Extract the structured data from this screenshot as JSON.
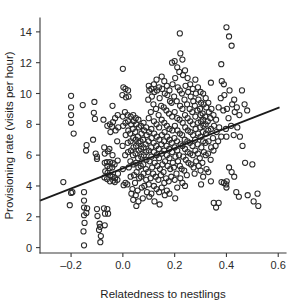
{
  "chart_data": {
    "type": "scatter",
    "title": "",
    "xlabel": "Relatedness to nestlings",
    "ylabel": "Provisioning rate (visits per hour)",
    "xlim": [
      -0.32,
      0.63
    ],
    "ylim": [
      -0.35,
      14.9
    ],
    "xticks": [
      -0.2,
      0.0,
      0.2,
      0.4,
      0.6
    ],
    "xticklabels": [
      "–0.2",
      "0.0",
      "0.2",
      "0.4",
      "0.6"
    ],
    "yticks": [
      0,
      2,
      4,
      6,
      8,
      10,
      12,
      14
    ],
    "yticklabels": [
      "0",
      "2",
      "4",
      "6",
      "8",
      "10",
      "12",
      "14"
    ],
    "grid": false,
    "legend": null,
    "marker": {
      "shape": "open-circle",
      "size_px": 5.2,
      "edge_color": "#2a2a2a",
      "face_color": "none"
    },
    "trendline": {
      "type": "linear-fit",
      "x_start": -0.32,
      "y_start": 3.05,
      "x_end": 0.605,
      "y_end": 9.1,
      "slope": 6.47,
      "intercept": 5.12,
      "color": "#1a1a1a"
    },
    "x": [
      -0.23,
      -0.2,
      -0.2,
      -0.2,
      -0.2,
      -0.19,
      -0.195,
      -0.2,
      -0.205,
      -0.155,
      -0.15,
      -0.15,
      -0.15,
      -0.15,
      -0.148,
      -0.152,
      -0.15,
      -0.14,
      -0.142,
      -0.138,
      -0.141,
      -0.115,
      -0.11,
      -0.112,
      -0.108,
      -0.105,
      -0.1,
      -0.1,
      -0.1,
      -0.098,
      -0.09,
      -0.088,
      -0.092,
      -0.085,
      -0.087,
      -0.075,
      -0.072,
      -0.07,
      -0.07,
      -0.068,
      -0.071,
      -0.073,
      -0.069,
      -0.07,
      -0.06,
      -0.058,
      -0.062,
      -0.06,
      -0.059,
      -0.061,
      -0.06,
      -0.057,
      -0.05,
      -0.048,
      -0.052,
      -0.05,
      -0.051,
      -0.049,
      -0.05,
      -0.04,
      -0.038,
      -0.042,
      -0.04,
      -0.039,
      -0.041,
      -0.04,
      -0.037,
      -0.03,
      -0.028,
      -0.032,
      -0.03,
      -0.031,
      -0.02,
      -0.018,
      -0.022,
      -0.02,
      -0.019,
      -0.021,
      0.0,
      0.002,
      -0.002,
      0.0,
      0.001,
      -0.001,
      0.0,
      0.003,
      0.01,
      0.012,
      0.008,
      0.01,
      0.011,
      0.009,
      0.01,
      0.02,
      0.022,
      0.018,
      0.02,
      0.021,
      0.019,
      0.02,
      0.023,
      0.017,
      0.03,
      0.032,
      0.028,
      0.03,
      0.031,
      0.029,
      0.03,
      0.033,
      0.04,
      0.042,
      0.038,
      0.04,
      0.041,
      0.039,
      0.04,
      0.043,
      0.037,
      0.04,
      0.05,
      0.052,
      0.048,
      0.05,
      0.051,
      0.049,
      0.05,
      0.053,
      0.047,
      0.05,
      0.052,
      0.06,
      0.062,
      0.058,
      0.06,
      0.061,
      0.059,
      0.06,
      0.063,
      0.057,
      0.06,
      0.07,
      0.072,
      0.068,
      0.07,
      0.071,
      0.069,
      0.07,
      0.073,
      0.08,
      0.082,
      0.078,
      0.08,
      0.081,
      0.079,
      0.08,
      0.083,
      0.077,
      0.09,
      0.092,
      0.088,
      0.09,
      0.091,
      0.089,
      0.09,
      0.093,
      0.1,
      0.102,
      0.098,
      0.1,
      0.101,
      0.099,
      0.1,
      0.103,
      0.097,
      0.1,
      0.102,
      0.11,
      0.112,
      0.108,
      0.11,
      0.111,
      0.109,
      0.11,
      0.113,
      0.107,
      0.11,
      0.12,
      0.122,
      0.118,
      0.12,
      0.121,
      0.119,
      0.12,
      0.123,
      0.117,
      0.12,
      0.122,
      0.13,
      0.132,
      0.128,
      0.13,
      0.131,
      0.129,
      0.13,
      0.133,
      0.127,
      0.13,
      0.14,
      0.142,
      0.138,
      0.14,
      0.141,
      0.139,
      0.14,
      0.143,
      0.137,
      0.14,
      0.142,
      0.15,
      0.152,
      0.148,
      0.15,
      0.151,
      0.149,
      0.15,
      0.153,
      0.147,
      0.15,
      0.16,
      0.162,
      0.158,
      0.16,
      0.161,
      0.159,
      0.16,
      0.163,
      0.157,
      0.16,
      0.162,
      0.17,
      0.172,
      0.168,
      0.17,
      0.171,
      0.169,
      0.17,
      0.173,
      0.167,
      0.17,
      0.18,
      0.182,
      0.178,
      0.18,
      0.181,
      0.179,
      0.18,
      0.183,
      0.177,
      0.18,
      0.19,
      0.192,
      0.188,
      0.19,
      0.191,
      0.189,
      0.19,
      0.193,
      0.187,
      0.2,
      0.202,
      0.198,
      0.2,
      0.201,
      0.199,
      0.2,
      0.203,
      0.197,
      0.2,
      0.202,
      0.21,
      0.212,
      0.208,
      0.21,
      0.211,
      0.209,
      0.21,
      0.213,
      0.207,
      0.21,
      0.22,
      0.222,
      0.218,
      0.22,
      0.221,
      0.219,
      0.22,
      0.223,
      0.217,
      0.22,
      0.222,
      0.23,
      0.232,
      0.228,
      0.23,
      0.231,
      0.229,
      0.23,
      0.233,
      0.227,
      0.23,
      0.24,
      0.242,
      0.238,
      0.24,
      0.241,
      0.239,
      0.24,
      0.243,
      0.237,
      0.24,
      0.25,
      0.252,
      0.248,
      0.25,
      0.251,
      0.249,
      0.25,
      0.253,
      0.247,
      0.26,
      0.262,
      0.258,
      0.26,
      0.261,
      0.259,
      0.26,
      0.263,
      0.27,
      0.272,
      0.268,
      0.27,
      0.271,
      0.269,
      0.27,
      0.273,
      0.28,
      0.282,
      0.278,
      0.28,
      0.281,
      0.279,
      0.28,
      0.283,
      0.277,
      0.29,
      0.292,
      0.288,
      0.29,
      0.291,
      0.289,
      0.29,
      0.293,
      0.3,
      0.302,
      0.298,
      0.3,
      0.301,
      0.299,
      0.3,
      0.303,
      0.297,
      0.3,
      0.302,
      0.31,
      0.312,
      0.308,
      0.31,
      0.311,
      0.309,
      0.31,
      0.313,
      0.307,
      0.31,
      0.32,
      0.322,
      0.318,
      0.32,
      0.321,
      0.319,
      0.32,
      0.323,
      0.33,
      0.332,
      0.328,
      0.33,
      0.331,
      0.329,
      0.33,
      0.34,
      0.342,
      0.338,
      0.34,
      0.341,
      0.339,
      0.34,
      0.35,
      0.352,
      0.348,
      0.35,
      0.351,
      0.36,
      0.362,
      0.358,
      0.36,
      0.37,
      0.372,
      0.368,
      0.37,
      0.38,
      0.382,
      0.378,
      0.38,
      0.381,
      0.39,
      0.392,
      0.388,
      0.39,
      0.4,
      0.402,
      0.398,
      0.4,
      0.401,
      0.399,
      0.4,
      0.41,
      0.412,
      0.408,
      0.41,
      0.42,
      0.422,
      0.418,
      0.42,
      0.43,
      0.432,
      0.428,
      0.43,
      0.44,
      0.442,
      0.438,
      0.45,
      0.452,
      0.448,
      0.46,
      0.462,
      0.47,
      0.472,
      0.48,
      0.482,
      0.5,
      0.505,
      0.52,
      0.523
    ],
    "y": [
      4.25,
      9.85,
      9.1,
      8.6,
      8.1,
      7.4,
      3.6,
      3.55,
      2.75,
      9.25,
      3.6,
      3.05,
      2.6,
      2.1,
      1.6,
      1.05,
      0.15,
      6.65,
      6.3,
      2.55,
      2.25,
      7.0,
      9.45,
      8.75,
      8.35,
      6.1,
      5.9,
      5.75,
      2.5,
      2.05,
      1.55,
      1.35,
      1.15,
      0.75,
      0.35,
      8.3,
      6.5,
      6.1,
      5.5,
      4.95,
      4.55,
      2.55,
      2.2,
      1.45,
      7.9,
      6.25,
      5.55,
      5.3,
      4.85,
      4.45,
      2.5,
      2.2,
      8.0,
      7.5,
      6.4,
      5.55,
      5.15,
      4.7,
      4.3,
      9.2,
      8.15,
      7.85,
      6.0,
      5.5,
      5.2,
      4.6,
      4.35,
      8.4,
      7.6,
      5.4,
      4.5,
      4.25,
      8.6,
      7.8,
      6.9,
      5.65,
      4.8,
      4.4,
      11.6,
      10.4,
      9.9,
      8.5,
      7.9,
      6.6,
      5.1,
      4.05,
      10.3,
      9.75,
      8.8,
      8.1,
      7.3,
      6.0,
      4.2,
      10.2,
      9.8,
      8.6,
      8.2,
      7.6,
      6.8,
      6.2,
      5.2,
      4.1,
      8.5,
      8.0,
      7.4,
      6.9,
      6.3,
      5.6,
      4.6,
      3.5,
      8.6,
      8.2,
      7.7,
      7.1,
      6.5,
      6.0,
      5.4,
      4.7,
      3.8,
      3.1,
      8.4,
      8.0,
      7.5,
      7.0,
      6.6,
      6.1,
      5.5,
      4.9,
      4.2,
      3.4,
      2.7,
      8.3,
      7.8,
      7.2,
      6.8,
      6.3,
      5.8,
      5.2,
      4.5,
      3.7,
      3.0,
      7.9,
      7.4,
      6.9,
      6.4,
      5.9,
      5.3,
      4.6,
      3.9,
      8.1,
      7.6,
      7.0,
      6.5,
      6.0,
      5.4,
      4.8,
      4.0,
      3.2,
      7.8,
      7.3,
      6.7,
      6.2,
      5.7,
      5.1,
      4.4,
      3.6,
      10.5,
      10.2,
      9.6,
      8.4,
      7.5,
      6.9,
      6.3,
      5.6,
      4.9,
      4.1,
      3.3,
      10.3,
      9.8,
      8.8,
      7.7,
      7.1,
      6.5,
      5.9,
      5.2,
      4.5,
      3.5,
      10.6,
      10.1,
      9.3,
      8.2,
      7.4,
      6.8,
      6.2,
      5.5,
      4.8,
      4.0,
      3.0,
      10.9,
      10.2,
      9.0,
      8.0,
      7.2,
      6.6,
      6.0,
      5.3,
      4.6,
      3.8,
      10.4,
      9.7,
      8.6,
      7.8,
      7.0,
      6.4,
      5.8,
      5.1,
      4.4,
      3.6,
      2.8,
      11.1,
      10.3,
      9.2,
      8.3,
      7.3,
      6.7,
      6.1,
      5.4,
      4.7,
      3.9,
      10.8,
      10.0,
      9.1,
      8.1,
      7.5,
      6.9,
      6.3,
      5.6,
      4.9,
      4.2,
      3.4,
      10.5,
      9.9,
      8.9,
      7.9,
      7.2,
      6.6,
      6.0,
      5.3,
      4.5,
      3.7,
      10.2,
      9.5,
      8.7,
      7.7,
      7.0,
      6.4,
      5.8,
      5.1,
      4.3,
      3.5,
      12.0,
      10.6,
      9.4,
      8.5,
      7.6,
      6.8,
      6.2,
      5.5,
      4.6,
      12.1,
      11.0,
      9.8,
      8.8,
      7.9,
      7.1,
      6.5,
      5.9,
      5.2,
      4.4,
      3.2,
      11.7,
      10.4,
      9.5,
      8.4,
      7.6,
      6.9,
      6.3,
      5.6,
      4.8,
      3.9,
      13.9,
      12.6,
      11.4,
      10.2,
      9.2,
      8.3,
      7.4,
      6.7,
      6.0,
      5.3,
      4.5,
      12.2,
      11.2,
      10.0,
      9.0,
      8.1,
      7.3,
      6.6,
      5.9,
      5.1,
      4.2,
      11.5,
      10.5,
      9.6,
      8.6,
      7.8,
      7.0,
      6.4,
      5.7,
      5.0,
      4.0,
      11.0,
      10.1,
      9.3,
      8.4,
      7.6,
      6.9,
      6.2,
      5.5,
      4.7,
      10.6,
      9.8,
      9.0,
      8.2,
      7.5,
      6.8,
      6.1,
      5.4,
      10.3,
      9.5,
      8.8,
      8.0,
      7.3,
      6.6,
      6.0,
      5.2,
      10.9,
      10.0,
      9.2,
      8.5,
      7.7,
      7.0,
      6.3,
      5.6,
      4.8,
      10.4,
      9.6,
      8.9,
      8.1,
      7.4,
      6.7,
      6.1,
      5.3,
      10.1,
      9.4,
      9.0,
      8.6,
      8.2,
      7.8,
      7.2,
      6.5,
      5.8,
      5.0,
      4.1,
      10.0,
      9.3,
      8.7,
      8.3,
      7.9,
      7.5,
      6.9,
      6.2,
      5.5,
      4.6,
      9.7,
      9.1,
      8.5,
      8.0,
      7.4,
      6.8,
      6.0,
      5.1,
      9.4,
      8.8,
      8.2,
      7.6,
      6.9,
      6.1,
      4.9,
      10.7,
      9.0,
      8.4,
      7.7,
      6.5,
      5.7,
      4.3,
      8.6,
      7.9,
      7.1,
      6.3,
      2.9,
      8.3,
      7.5,
      6.6,
      2.6,
      9.1,
      7.8,
      6.9,
      2.9,
      11.9,
      10.8,
      9.7,
      7.2,
      4.25,
      10.6,
      9.9,
      8.9,
      4.2,
      14.3,
      9.0,
      7.7,
      7.2,
      4.3,
      4.1,
      3.9,
      13.7,
      10.2,
      8.4,
      5.2,
      13.1,
      9.3,
      7.9,
      4.9,
      9.6,
      8.8,
      7.3,
      4.6,
      9.1,
      7.8,
      3.6,
      8.6,
      7.2,
      3.3,
      10.2,
      6.6,
      9.3,
      5.5,
      8.9,
      3.4,
      5.4,
      3.0,
      3.5,
      2.7
    ]
  }
}
